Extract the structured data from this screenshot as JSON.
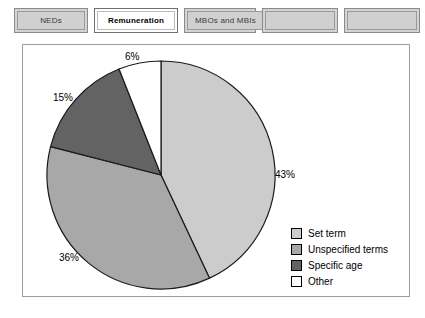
{
  "tabs": [
    {
      "label": "NEDs",
      "active": false,
      "width": "w-nar"
    },
    {
      "label": "Remuneration",
      "active": true,
      "width": "w-act"
    },
    {
      "label": "MBOs and MBIs",
      "active": false,
      "width": "w-mid"
    },
    {
      "label": "",
      "active": false,
      "width": "w-emp"
    },
    {
      "label": "",
      "active": false,
      "width": "w-emp"
    }
  ],
  "chart_data": {
    "type": "pie",
    "title": "",
    "categories": [
      "Set term",
      "Unspecified terms",
      "Specific age",
      "Other"
    ],
    "values": [
      43,
      36,
      15,
      6
    ],
    "value_labels": [
      "43%",
      "36%",
      "15%",
      "6%"
    ],
    "colors": [
      "#cccccc",
      "#a8a8a8",
      "#636363",
      "#ffffff"
    ],
    "slice_outline": "#1a1a1a",
    "start_angle_deg": 0,
    "direction": "clockwise",
    "legend_position": "bottom-right",
    "grid": false
  }
}
